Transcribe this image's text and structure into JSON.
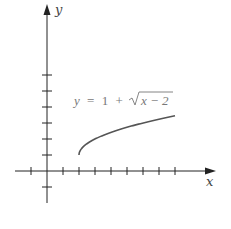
{
  "chart_data": {
    "type": "line",
    "title": "",
    "annotation": "y = 1 + √(x − 2)",
    "xlabel": "x",
    "ylabel": "y",
    "grid": false,
    "legend": "none",
    "xlim": [
      -1,
      10
    ],
    "ylim": [
      -1,
      7
    ],
    "x_ticks": [
      -1,
      1,
      2,
      3,
      4,
      5,
      6,
      7,
      8
    ],
    "y_ticks": [
      -1,
      1,
      2,
      3,
      4,
      5,
      6
    ],
    "series": [
      {
        "name": "y = 1 + sqrt(x - 2)",
        "x": [
          2,
          2.25,
          2.5,
          3,
          3.5,
          4,
          5,
          6,
          7,
          8
        ],
        "values": [
          1,
          1.5,
          1.71,
          2,
          2.22,
          2.41,
          2.73,
          3,
          3.24,
          3.45
        ]
      }
    ]
  },
  "labels": {
    "x_axis": "x",
    "y_axis": "y",
    "equation_lhs": "y",
    "equation_eq": "=",
    "equation_one": "1",
    "equation_plus": "+",
    "equation_radicand": "x − 2"
  },
  "colors": {
    "axis": "#222222",
    "curve": "#555555",
    "text": "#777777"
  }
}
